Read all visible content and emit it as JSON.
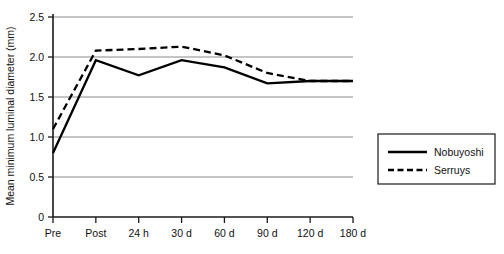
{
  "chart_data": {
    "type": "line",
    "title": "",
    "xlabel": "",
    "ylabel": "Mean minimum luminal diameter (mm)",
    "categories": [
      "Pre",
      "Post",
      "24 h",
      "30 d",
      "60 d",
      "90 d",
      "120 d",
      "180 d"
    ],
    "yticks": [
      "0",
      "0.5",
      "1.0",
      "1.5",
      "2.0",
      "2.5"
    ],
    "ytick_values": [
      0,
      0.5,
      1.0,
      1.5,
      2.0,
      2.5
    ],
    "ylim": [
      0,
      2.5
    ],
    "grid": true,
    "legend_position": "right",
    "series": [
      {
        "name": "Nobuyoshi",
        "style": "solid",
        "color": "#000000",
        "values": [
          0.8,
          1.96,
          1.77,
          1.96,
          1.87,
          1.67,
          1.7,
          1.7
        ]
      },
      {
        "name": "Serruys",
        "style": "dashed",
        "color": "#000000",
        "values": [
          1.1,
          2.08,
          2.1,
          2.13,
          2.02,
          1.8,
          1.7,
          1.7
        ]
      }
    ]
  },
  "legend": {
    "entries": [
      {
        "label": "Nobuyoshi",
        "style": "solid"
      },
      {
        "label": "Serruys",
        "style": "dashed"
      }
    ]
  }
}
